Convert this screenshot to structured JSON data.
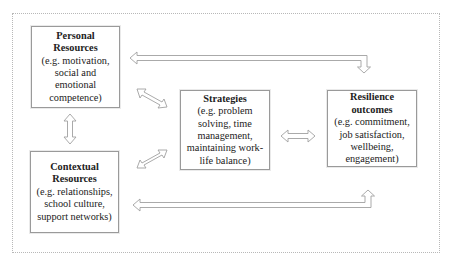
{
  "diagram": {
    "type": "conceptual model",
    "nodes": [
      {
        "id": "personal",
        "title": "Personal\nResources",
        "desc": "(e.g. motivation,\nsocial and\nemotional\ncompetence)"
      },
      {
        "id": "contextual",
        "title": "Contextual\nResources",
        "desc": "(e.g. relationships,\nschool culture,\nsupport networks)"
      },
      {
        "id": "strategies",
        "title": "Strategies",
        "desc": "(e.g. problem\nsolving, time\nmanagement,\nmaintaining work-\nlife balance)"
      },
      {
        "id": "outcomes",
        "title": "Resilience\noutcomes",
        "desc": "(e.g. commitment,\njob satisfaction,\nwellbeing,\nengagement)"
      }
    ],
    "edges": [
      {
        "from": "personal",
        "to": "contextual",
        "type": "bidirectional"
      },
      {
        "from": "personal",
        "to": "strategies",
        "type": "bidirectional"
      },
      {
        "from": "contextual",
        "to": "strategies",
        "type": "bidirectional"
      },
      {
        "from": "strategies",
        "to": "outcomes",
        "type": "bidirectional"
      },
      {
        "from": "personal",
        "to": "outcomes",
        "type": "bidirectional"
      },
      {
        "from": "contextual",
        "to": "outcomes",
        "type": "bidirectional"
      }
    ],
    "colors": {
      "border": "#9a9a9a",
      "arrow": "#a0a0a0",
      "frame": "#b8b8b8"
    }
  }
}
